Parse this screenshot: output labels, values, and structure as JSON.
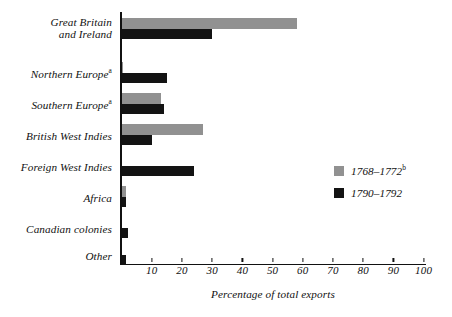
{
  "chart_data": {
    "type": "bar",
    "orientation": "horizontal",
    "title": "",
    "xlabel": "Percentage of total exports",
    "ylabel": "",
    "xlim": [
      0,
      105
    ],
    "xticks": [
      10,
      20,
      30,
      40,
      50,
      60,
      70,
      80,
      90,
      100
    ],
    "grid": false,
    "legend_position": "right-middle",
    "categories": [
      "Great Britain and Ireland",
      "Northern Europe",
      "Southern Europe",
      "British West Indies",
      "Foreign West Indies",
      "Africa",
      "Canadian colonies",
      "Other"
    ],
    "category_footnotes": [
      "",
      "a",
      "a",
      "",
      "",
      "",
      "",
      ""
    ],
    "series": [
      {
        "name": "1768-1772",
        "footnote": "b",
        "color": "#919191",
        "values": [
          58,
          0.5,
          13,
          27,
          0,
          1.5,
          0,
          0
        ]
      },
      {
        "name": "1790-1792",
        "footnote": "",
        "color": "#131313",
        "values": [
          30,
          15,
          14,
          10,
          24,
          1.5,
          2,
          1.5
        ]
      }
    ]
  },
  "axis": {
    "x_title": "Percentage of total exports",
    "tick_labels": [
      "10",
      "20",
      "30",
      "40",
      "50",
      "60",
      "70",
      "80",
      "90",
      "100"
    ]
  },
  "categories": [
    {
      "line1": "Great Britain",
      "line2": "and Ireland",
      "sup": ""
    },
    {
      "line1": "Northern Europe",
      "line2": "",
      "sup": "a"
    },
    {
      "line1": "Southern Europe",
      "line2": "",
      "sup": "a"
    },
    {
      "line1": "British West Indies",
      "line2": "",
      "sup": ""
    },
    {
      "line1": "Foreign West Indies",
      "line2": "",
      "sup": ""
    },
    {
      "line1": "Africa",
      "line2": "",
      "sup": ""
    },
    {
      "line1": "Canadian colonies",
      "line2": "",
      "sup": ""
    },
    {
      "line1": "Other",
      "line2": "",
      "sup": ""
    }
  ],
  "legend": [
    {
      "label": "1768–1772",
      "sup": "b",
      "color": "#919191"
    },
    {
      "label": "1790–1792",
      "sup": "",
      "color": "#131313"
    }
  ]
}
